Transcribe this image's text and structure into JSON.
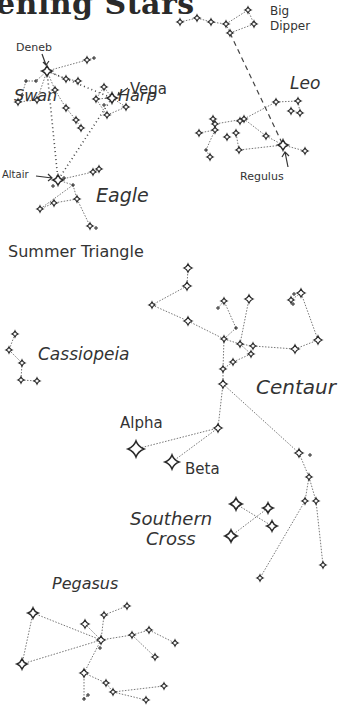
{
  "title": "ening Stars",
  "colors": {
    "ink": "#2a2a2a",
    "line": "#777777",
    "background": "#ffffff"
  },
  "labels": {
    "deneb": "Deneb",
    "vega": "Vega",
    "swan": "Swan",
    "harp": "Harp",
    "altair": "Altair",
    "eagle": "Eagle",
    "summer_triangle": "Summer Triangle",
    "big_dipper_1": "Big",
    "big_dipper_2": "Dipper",
    "leo": "Leo",
    "regulus": "Regulus",
    "cassiopeia": "Cassiopeia",
    "centaur": "Centaur",
    "alpha": "Alpha",
    "beta": "Beta",
    "southern_cross_1": "Southern",
    "southern_cross_2": "Cross",
    "pegasus": "Pegasus"
  },
  "chart_data": {
    "type": "diagram",
    "title": "ening Stars",
    "constellations": [
      {
        "name": "Big Dipper",
        "stars": [
          [
            180,
            22,
            3
          ],
          [
            197,
            18,
            3
          ],
          [
            211,
            22,
            3
          ],
          [
            226,
            24,
            3
          ],
          [
            230,
            33,
            3
          ],
          [
            248,
            10,
            3
          ],
          [
            254,
            24,
            3
          ]
        ],
        "lines": [
          [
            0,
            1
          ],
          [
            1,
            2
          ],
          [
            2,
            3
          ],
          [
            3,
            4
          ],
          [
            3,
            5
          ],
          [
            5,
            6
          ],
          [
            6,
            4
          ]
        ]
      },
      {
        "name": "Swan",
        "stars": [
          [
            47,
            71,
            5
          ],
          [
            36,
            81,
            2
          ],
          [
            26,
            81,
            2
          ],
          [
            22,
            95,
            2
          ],
          [
            18,
            102,
            3
          ],
          [
            37,
            100,
            3
          ],
          [
            55,
            90,
            3
          ],
          [
            66,
            79,
            3
          ],
          [
            78,
            81,
            3
          ],
          [
            87,
            60,
            3
          ],
          [
            94,
            58,
            2
          ],
          [
            66,
            108,
            3
          ],
          [
            76,
            120,
            3
          ],
          [
            81,
            128,
            3
          ]
        ],
        "lines": [
          [
            0,
            7
          ],
          [
            7,
            8
          ],
          [
            0,
            9
          ],
          [
            9,
            10
          ],
          [
            0,
            1
          ],
          [
            1,
            2
          ],
          [
            2,
            3
          ],
          [
            0,
            5
          ],
          [
            5,
            4
          ],
          [
            0,
            6
          ],
          [
            6,
            11
          ],
          [
            11,
            12
          ],
          [
            12,
            13
          ]
        ]
      },
      {
        "name": "Harp",
        "stars": [
          [
            112,
            98,
            5
          ],
          [
            104,
            87,
            3
          ],
          [
            96,
            99,
            3
          ],
          [
            107,
            115,
            3
          ],
          [
            126,
            107,
            3
          ],
          [
            104,
            105,
            2
          ]
        ],
        "lines": [
          [
            0,
            1
          ],
          [
            0,
            4
          ],
          [
            0,
            2
          ],
          [
            2,
            3
          ],
          [
            3,
            4
          ],
          [
            1,
            2
          ]
        ]
      },
      {
        "name": "Eagle",
        "stars": [
          [
            58,
            180,
            5
          ],
          [
            64,
            178,
            2
          ],
          [
            53,
            186,
            2
          ],
          [
            73,
            185,
            2
          ],
          [
            77,
            199,
            3
          ],
          [
            93,
            172,
            3
          ],
          [
            99,
            169,
            3
          ],
          [
            54,
            203,
            3
          ],
          [
            40,
            209,
            3
          ],
          [
            90,
            226,
            3
          ],
          [
            96,
            228,
            2
          ]
        ],
        "lines": [
          [
            0,
            3
          ],
          [
            3,
            4
          ],
          [
            4,
            9
          ],
          [
            0,
            5
          ],
          [
            5,
            6
          ],
          [
            4,
            7
          ],
          [
            7,
            8
          ],
          [
            3,
            8
          ]
        ]
      },
      {
        "name": "Summer Triangle",
        "dotted": true,
        "stars": [],
        "points": [
          [
            47,
            71
          ],
          [
            112,
            98
          ],
          [
            58,
            180
          ]
        ],
        "lines": [
          [
            0,
            1
          ],
          [
            1,
            2
          ],
          [
            2,
            0
          ]
        ]
      },
      {
        "name": "Leo",
        "stars": [
          [
            283,
            145,
            5
          ],
          [
            266,
            136,
            3
          ],
          [
            244,
            119,
            3
          ],
          [
            240,
            121,
            3
          ],
          [
            276,
            102,
            3
          ],
          [
            298,
            101,
            3
          ],
          [
            300,
            113,
            3
          ],
          [
            291,
            111,
            3
          ],
          [
            236,
            133,
            3
          ],
          [
            239,
            150,
            3
          ],
          [
            215,
            124,
            3
          ],
          [
            227,
            137,
            3
          ],
          [
            213,
            119,
            3
          ],
          [
            215,
            130,
            3
          ],
          [
            199,
            133,
            3
          ],
          [
            206,
            150,
            2
          ],
          [
            210,
            157,
            3
          ],
          [
            305,
            151,
            3
          ]
        ],
        "lines": [
          [
            0,
            17
          ],
          [
            0,
            1
          ],
          [
            1,
            2
          ],
          [
            2,
            4
          ],
          [
            4,
            5
          ],
          [
            5,
            6
          ],
          [
            6,
            7
          ],
          [
            2,
            10
          ],
          [
            10,
            12
          ],
          [
            12,
            13
          ],
          [
            13,
            14
          ],
          [
            13,
            15
          ],
          [
            15,
            16
          ],
          [
            0,
            9
          ],
          [
            9,
            8
          ]
        ]
      },
      {
        "name": "Dipper to Regulus",
        "dashed": true,
        "stars": [],
        "points": [
          [
            230,
            33
          ],
          [
            283,
            145
          ]
        ],
        "lines": [
          [
            0,
            1
          ]
        ]
      },
      {
        "name": "Cassiopeia",
        "stars": [
          [
            15,
            334,
            3
          ],
          [
            9,
            350,
            3
          ],
          [
            22,
            363,
            3
          ],
          [
            21,
            380,
            3
          ],
          [
            37,
            381,
            3
          ]
        ],
        "lines": [
          [
            0,
            1
          ],
          [
            1,
            2
          ],
          [
            2,
            3
          ],
          [
            3,
            4
          ]
        ]
      },
      {
        "name": "Centaur",
        "stars": [
          [
            188,
            268,
            4
          ],
          [
            187,
            286,
            4
          ],
          [
            152,
            305,
            3
          ],
          [
            188,
            321,
            4
          ],
          [
            224,
            339,
            3
          ],
          [
            240,
            344,
            3
          ],
          [
            253,
            346,
            3
          ],
          [
            295,
            349,
            4
          ],
          [
            318,
            340,
            4
          ],
          [
            301,
            293,
            4
          ],
          [
            291,
            300,
            3
          ],
          [
            294,
            294,
            2
          ],
          [
            293,
            304,
            2
          ],
          [
            249,
            299,
            4
          ],
          [
            224,
            301,
            3
          ],
          [
            218,
            308,
            2
          ],
          [
            236,
            328,
            2
          ],
          [
            251,
            354,
            3
          ],
          [
            233,
            362,
            3
          ],
          [
            223,
            369,
            3
          ],
          [
            223,
            384,
            4
          ],
          [
            218,
            428,
            4
          ],
          [
            299,
            453,
            4
          ],
          [
            310,
            455,
            2
          ],
          [
            309,
            477,
            3
          ],
          [
            305,
            501,
            3
          ],
          [
            316,
            501,
            3
          ],
          [
            323,
            565,
            3
          ],
          [
            260,
            578,
            3
          ]
        ],
        "lines": [
          [
            0,
            1
          ],
          [
            1,
            2
          ],
          [
            2,
            3
          ],
          [
            3,
            4
          ],
          [
            4,
            5
          ],
          [
            5,
            6
          ],
          [
            6,
            7
          ],
          [
            7,
            8
          ],
          [
            8,
            9
          ],
          [
            9,
            10
          ],
          [
            4,
            16
          ],
          [
            16,
            14
          ],
          [
            14,
            15
          ],
          [
            5,
            13
          ],
          [
            5,
            17
          ],
          [
            17,
            18
          ],
          [
            18,
            19
          ],
          [
            19,
            20
          ],
          [
            20,
            21
          ],
          [
            20,
            22
          ],
          [
            22,
            24
          ],
          [
            24,
            25
          ],
          [
            24,
            26
          ],
          [
            26,
            27
          ],
          [
            25,
            28
          ],
          [
            4,
            19
          ]
        ]
      },
      {
        "name": "Alpha Beta",
        "stars": [
          [
            136,
            449,
            8
          ],
          [
            172,
            462,
            7
          ]
        ],
        "points": [
          [
            218,
            428
          ]
        ],
        "lines": []
      },
      {
        "name": "Southern Cross",
        "stars": [
          [
            236,
            504,
            6
          ],
          [
            268,
            508,
            5
          ],
          [
            272,
            526,
            5
          ],
          [
            231,
            536,
            6
          ]
        ],
        "lines": [
          [
            0,
            2
          ],
          [
            1,
            3
          ]
        ]
      },
      {
        "name": "Pegasus",
        "stars": [
          [
            33,
            613,
            5
          ],
          [
            22,
            664,
            5
          ],
          [
            85,
            624,
            4
          ],
          [
            101,
            640,
            4
          ],
          [
            104,
            615,
            3
          ],
          [
            127,
            606,
            3
          ],
          [
            100,
            648,
            2
          ],
          [
            132,
            635,
            3
          ],
          [
            149,
            630,
            3
          ],
          [
            175,
            643,
            3
          ],
          [
            155,
            657,
            3
          ],
          [
            84,
            673,
            4
          ],
          [
            106,
            683,
            3
          ],
          [
            113,
            692,
            3
          ],
          [
            164,
            686,
            3
          ],
          [
            146,
            700,
            3
          ],
          [
            84,
            699,
            2
          ],
          [
            88,
            695,
            2
          ]
        ],
        "lines": [
          [
            0,
            3
          ],
          [
            0,
            1
          ],
          [
            1,
            3
          ],
          [
            3,
            2
          ],
          [
            3,
            4
          ],
          [
            4,
            5
          ],
          [
            3,
            7
          ],
          [
            7,
            8
          ],
          [
            8,
            9
          ],
          [
            7,
            10
          ],
          [
            3,
            11
          ],
          [
            11,
            12
          ],
          [
            12,
            13
          ],
          [
            13,
            14
          ],
          [
            13,
            15
          ],
          [
            11,
            16
          ],
          [
            16,
            17
          ]
        ]
      }
    ],
    "extra_lines": [
      [
        [
          136,
          449
        ],
        [
          218,
          428
        ]
      ],
      [
        [
          172,
          462
        ],
        [
          218,
          428
        ]
      ]
    ],
    "annotations": [
      {
        "text": "Deneb",
        "arrow_to": [
          47,
          71
        ]
      },
      {
        "text": "Vega",
        "arrow_to": [
          112,
          98
        ]
      },
      {
        "text": "Altair",
        "arrow_to": [
          58,
          180
        ]
      },
      {
        "text": "Regulus",
        "arrow_to": [
          283,
          145
        ]
      }
    ]
  }
}
